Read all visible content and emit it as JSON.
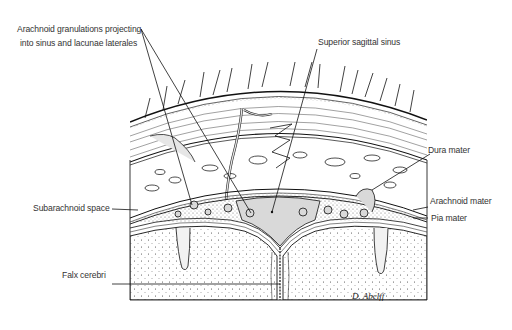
{
  "figure": {
    "labels": {
      "arachnoid_granulations_line1": "Arachnoid granulations projecting",
      "arachnoid_granulations_line2": "into sinus and lacunae laterales",
      "superior_sagittal_sinus": "Superior sagittal sinus",
      "dura_mater": "Dura mater",
      "subarachnoid_space": "Subarachnoid space",
      "arachnoid_mater": "Arachnoid mater",
      "pia_mater": "Pia mater",
      "falx_cerebri": "Falx cerebri"
    },
    "signature": "D. Abelff",
    "colors": {
      "line": "#1a1a1a",
      "sinus_fill": "#d9d9d9",
      "text": "#333333",
      "background": "#ffffff"
    }
  }
}
